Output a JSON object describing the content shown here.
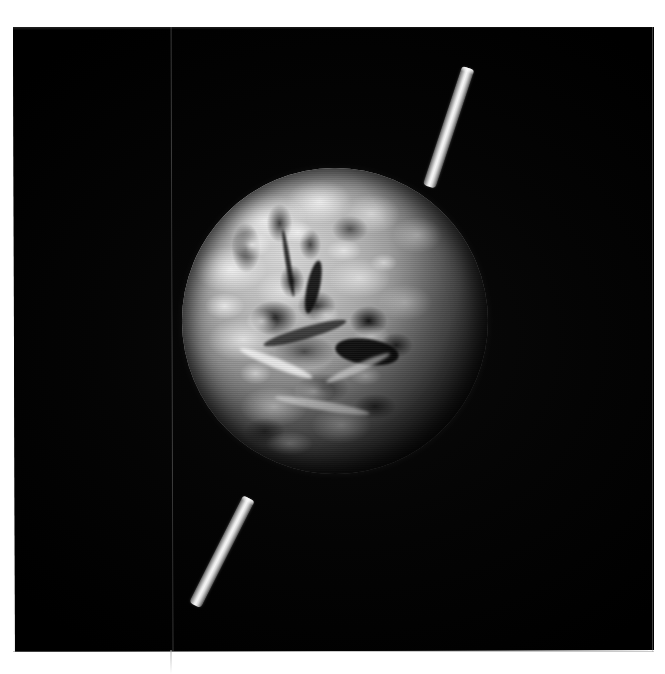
{
  "image": {
    "kind": "photograph",
    "subject": "Earth globe model on an axis rod photographed against a black background",
    "medium": "black-and-white halftone print",
    "alt_text": "Grayscale photograph of a globe of the Earth, lit from the upper left, with a pale cylindrical axis rod protruding from the north and south poles, set against a solid black background.",
    "palette": {
      "paper": "#ffffff",
      "space": "#010101",
      "globe_highlight": "#f0f0f0",
      "globe_midtone": "#8e8e8e",
      "globe_shadow": "#101010",
      "rod_light": "#f6f6f6",
      "rod_dark": "#4a4a4a",
      "seam": "#8c8c8c"
    },
    "plate": {
      "left": 13,
      "top": 27,
      "width": 641,
      "height": 625
    },
    "globe": {
      "center_x": 321,
      "center_y": 295,
      "radius": 153,
      "light_direction": "upper-left",
      "terminator": "lower-right limb fades to black"
    },
    "rods": [
      {
        "name": "north-pole-axis-rod",
        "angle_deg": 18.5,
        "length": 125
      },
      {
        "name": "south-pole-axis-rod",
        "angle_deg": 27.0,
        "length": 120
      }
    ],
    "seam": {
      "x": 170,
      "description": "faint vertical scan fold line crossing the full print"
    }
  }
}
